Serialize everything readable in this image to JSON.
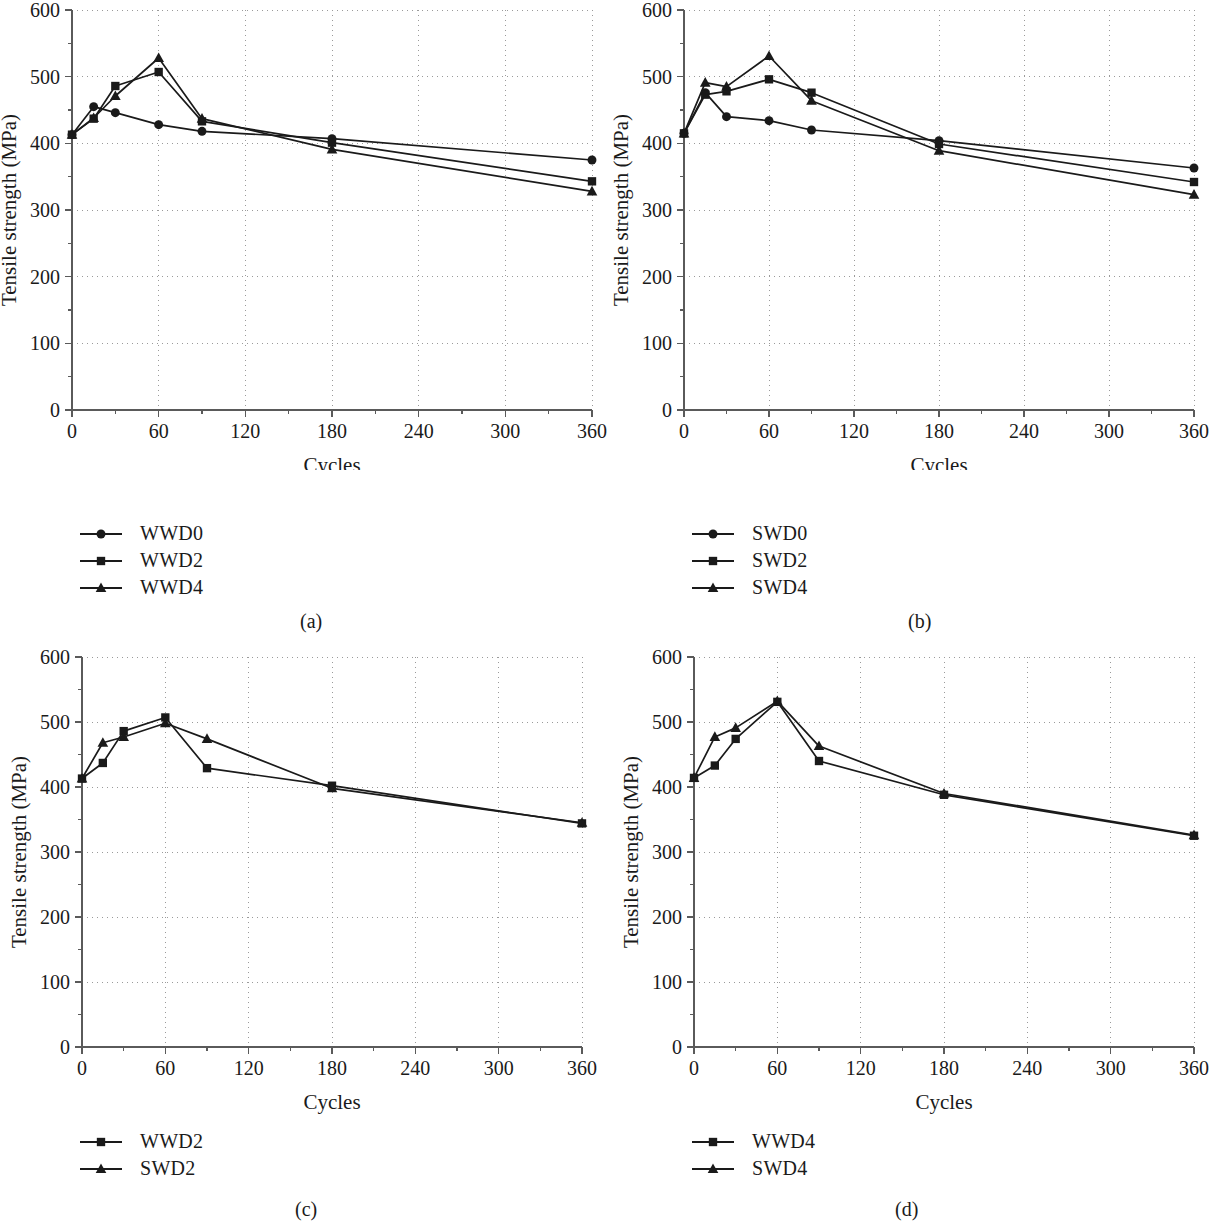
{
  "figure": {
    "panel_labels": [
      "(a)",
      "(b)",
      "(c)",
      "(d)"
    ],
    "axis": {
      "xlabel": "Cycles",
      "ylabel": "Tensile strength (MPa)",
      "xticks": [
        "0",
        "60",
        "120",
        "180",
        "240",
        "300",
        "360"
      ],
      "yticks": [
        "0",
        "100",
        "200",
        "300",
        "400",
        "500",
        "600"
      ],
      "xlim": [
        0,
        360
      ],
      "ylim": [
        0,
        600
      ],
      "grid": "dotted",
      "line_color": "#1a1a1a",
      "grid_color": "#9a9a9a"
    }
  },
  "chart_data": [
    {
      "type": "line",
      "panel": "(a)",
      "title": "",
      "xlabel": "Cycles",
      "ylabel": "Tensile strength (MPa)",
      "xlim": [
        0,
        360
      ],
      "ylim": [
        0,
        600
      ],
      "grid": true,
      "legend_position": "below-left",
      "x": [
        0,
        15,
        30,
        60,
        90,
        180,
        360
      ],
      "series": [
        {
          "name": "WWD0",
          "marker": "circle",
          "values": [
            413,
            455,
            446,
            428,
            418,
            407,
            375
          ]
        },
        {
          "name": "WWD2",
          "marker": "square",
          "values": [
            413,
            437,
            486,
            507,
            433,
            401,
            343
          ]
        },
        {
          "name": "WWD4",
          "marker": "triangle",
          "values": [
            413,
            438,
            471,
            528,
            437,
            391,
            328
          ]
        }
      ]
    },
    {
      "type": "line",
      "panel": "(b)",
      "title": "",
      "xlabel": "Cycles",
      "ylabel": "Tensile strength (MPa)",
      "xlim": [
        0,
        360
      ],
      "ylim": [
        0,
        600
      ],
      "grid": true,
      "legend_position": "below-left",
      "x": [
        0,
        15,
        30,
        60,
        90,
        180,
        360
      ],
      "series": [
        {
          "name": "SWD0",
          "marker": "circle",
          "values": [
            415,
            476,
            440,
            434,
            420,
            404,
            363
          ]
        },
        {
          "name": "SWD2",
          "marker": "square",
          "values": [
            415,
            473,
            478,
            496,
            476,
            399,
            342
          ]
        },
        {
          "name": "SWD4",
          "marker": "triangle",
          "values": [
            415,
            491,
            485,
            531,
            464,
            389,
            323
          ]
        }
      ]
    },
    {
      "type": "line",
      "panel": "(c)",
      "title": "",
      "xlabel": "Cycles",
      "ylabel": "Tensile strength (MPa)",
      "xlim": [
        0,
        360
      ],
      "ylim": [
        0,
        600
      ],
      "grid": true,
      "legend_position": "below-left",
      "x": [
        0,
        15,
        30,
        60,
        90,
        180,
        360
      ],
      "series": [
        {
          "name": "WWD2",
          "marker": "square",
          "values": [
            413,
            437,
            486,
            507,
            429,
            402,
            344
          ]
        },
        {
          "name": "SWD2",
          "marker": "triangle",
          "values": [
            413,
            468,
            477,
            498,
            474,
            398,
            345
          ]
        }
      ]
    },
    {
      "type": "line",
      "panel": "(d)",
      "title": "",
      "xlabel": "Cycles",
      "ylabel": "Tensile strength (MPa)",
      "xlim": [
        0,
        360
      ],
      "ylim": [
        0,
        600
      ],
      "grid": true,
      "legend_position": "below-left",
      "x": [
        0,
        15,
        30,
        60,
        90,
        180,
        360
      ],
      "series": [
        {
          "name": "WWD4",
          "marker": "square",
          "values": [
            414,
            433,
            474,
            531,
            440,
            388,
            325
          ]
        },
        {
          "name": "SWD4",
          "marker": "triangle",
          "values": [
            414,
            477,
            491,
            532,
            463,
            390,
            326
          ]
        }
      ]
    }
  ],
  "legends": [
    {
      "panel": "(a)",
      "items": [
        {
          "label": "WWD0",
          "marker": "circle"
        },
        {
          "label": "WWD2",
          "marker": "square"
        },
        {
          "label": "WWD4",
          "marker": "triangle"
        }
      ]
    },
    {
      "panel": "(b)",
      "items": [
        {
          "label": "SWD0",
          "marker": "circle"
        },
        {
          "label": "SWD2",
          "marker": "square"
        },
        {
          "label": "SWD4",
          "marker": "triangle"
        }
      ]
    },
    {
      "panel": "(c)",
      "items": [
        {
          "label": "WWD2",
          "marker": "square"
        },
        {
          "label": "SWD2",
          "marker": "triangle"
        }
      ]
    },
    {
      "panel": "(d)",
      "items": [
        {
          "label": "WWD4",
          "marker": "square"
        },
        {
          "label": "SWD4",
          "marker": "triangle"
        }
      ]
    }
  ]
}
